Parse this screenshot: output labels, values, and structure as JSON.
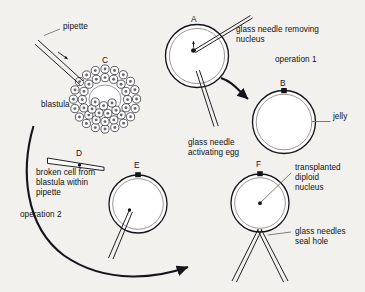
{
  "figure": {
    "background_color": "#f2f1ee",
    "ink_color": "#15141a",
    "inner_line_color": "#8f8d8a"
  },
  "stages": {
    "A": {
      "letter": "A",
      "name": "unfertilized egg with nucleus being removed"
    },
    "B": {
      "letter": "B",
      "name": "enucleated activated egg with jelly coat"
    },
    "C": {
      "letter": "C",
      "name": "blastula"
    },
    "D": {
      "letter": "D",
      "name": "broken cell within pipette"
    },
    "E": {
      "letter": "E",
      "name": "egg receiving donor nucleus"
    },
    "F": {
      "letter": "F",
      "name": "egg with transplanted diploid nucleus"
    }
  },
  "labels": {
    "pipette": "pipette",
    "blastula": "blastula",
    "glass_needle_removing_nucleus": "glass needle removing\nnucleus",
    "operation_1": "operation 1",
    "jelly": "jelly",
    "glass_needle_activating_egg": "glass needle\nactivating egg",
    "broken_cell": "broken cell from\nblastula within\npipette",
    "operation_2": "operation 2",
    "transplanted_nucleus": "transplanted\ndiploid\nnucleus",
    "glass_needles_seal_hole": "glass needles\nseal hole"
  },
  "letters": {
    "A": "A",
    "B": "B",
    "C": "C",
    "D": "D",
    "E": "E",
    "F": "F"
  }
}
